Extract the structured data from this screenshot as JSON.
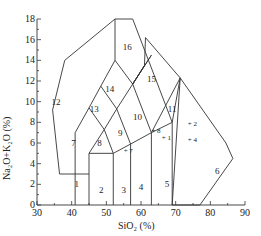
{
  "chart_data": {
    "type": "diagram",
    "title": "",
    "xlabel": "SiO2 (%)",
    "ylabel": "Na2O+K2O (%)",
    "xlim": [
      30,
      90
    ],
    "ylim": [
      0,
      18
    ],
    "x_ticks": [
      30,
      40,
      50,
      60,
      70,
      80,
      90
    ],
    "y_ticks": [
      0,
      2,
      4,
      6,
      8,
      10,
      12,
      14,
      16,
      18
    ],
    "grid": false,
    "fields": [
      {
        "label": "1",
        "x": 41.5,
        "y": 2.0
      },
      {
        "label": "2",
        "x": 48.5,
        "y": 1.5
      },
      {
        "label": "3",
        "x": 55.0,
        "y": 1.5
      },
      {
        "label": "4",
        "x": 60.0,
        "y": 1.7
      },
      {
        "label": "5",
        "x": 67.5,
        "y": 2.0
      },
      {
        "label": "6",
        "x": 82.0,
        "y": 3.3
      },
      {
        "label": "7",
        "x": 40.5,
        "y": 6.0
      },
      {
        "label": "8",
        "x": 48.0,
        "y": 6.0
      },
      {
        "label": "9",
        "x": 54.0,
        "y": 7.0
      },
      {
        "label": "10",
        "x": 59.0,
        "y": 8.5
      },
      {
        "label": "11",
        "x": 69.0,
        "y": 9.3
      },
      {
        "label": "12",
        "x": 35.5,
        "y": 10.0
      },
      {
        "label": "13",
        "x": 46.5,
        "y": 9.3
      },
      {
        "label": "14",
        "x": 51.0,
        "y": 11.2
      },
      {
        "label": "15",
        "x": 63.0,
        "y": 12.2
      },
      {
        "label": "16",
        "x": 56.0,
        "y": 15.3
      }
    ],
    "samples": [
      {
        "label": "1",
        "x": 66.0,
        "y": 6.5
      },
      {
        "label": "2",
        "x": 73.5,
        "y": 7.8
      },
      {
        "label": "4",
        "x": 73.5,
        "y": 6.3
      },
      {
        "label": "7",
        "x": 55.0,
        "y": 5.2
      },
      {
        "label": "8",
        "x": 63.0,
        "y": 7.2
      }
    ]
  },
  "axis": {
    "x_title": "SiO₂ (%)",
    "y_title": "Na₂O+K₂O (%)",
    "x_tick_labels": [
      "30",
      "40",
      "50",
      "60",
      "70",
      "80",
      "90"
    ],
    "y_tick_labels": [
      "0",
      "2",
      "4",
      "6",
      "8",
      "10",
      "12",
      "14",
      "16",
      "18"
    ]
  }
}
